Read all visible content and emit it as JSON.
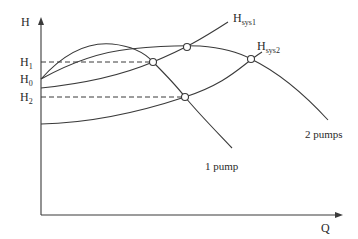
{
  "diagram": {
    "title": "",
    "axes": {
      "y_label": "H",
      "x_label": "Q"
    },
    "levels": [
      {
        "name": "H1",
        "main": "H",
        "sub": "1"
      },
      {
        "name": "H0",
        "main": "H",
        "sub": "0"
      },
      {
        "name": "H2",
        "main": "H",
        "sub": "2"
      }
    ],
    "curves": {
      "one_pump": {
        "label": "1 pump"
      },
      "two_pumps": {
        "label": "2 pumps"
      },
      "system1": {
        "main": "H",
        "sub": "sys1"
      },
      "system2": {
        "main": "H",
        "sub": "sys2"
      }
    },
    "operating_points": [
      {
        "name": "1 pump with Hsys1",
        "level": "H1"
      },
      {
        "name": "2 pumps with Hsys1"
      },
      {
        "name": "1 pump with Hsys2",
        "level": "H2"
      },
      {
        "name": "2 pumps with Hsys2"
      }
    ],
    "colors": {
      "line": "#3a3a3a",
      "background": "#ffffff"
    }
  }
}
